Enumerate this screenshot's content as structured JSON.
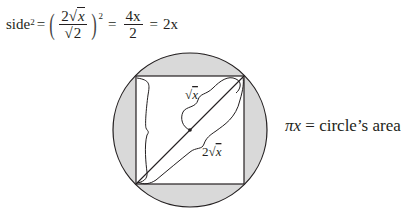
{
  "equation": {
    "lhs": "side",
    "lhs_exponent": "2",
    "equals": "=",
    "fraction1": {
      "numerator_coeff": "2",
      "numerator_radicand": "x",
      "denominator_radicand": "2"
    },
    "outer_exponent": "2",
    "fraction2": {
      "numerator": "4x",
      "denominator": "2"
    },
    "result": "2x"
  },
  "figure": {
    "circle_fill": "#d9d9d9",
    "stroke": "#231f20",
    "label_half_diagonal": "√x",
    "label_full_diagonal": "2√x"
  },
  "caption": {
    "symbol": "πx",
    "text": " = circle’s area"
  }
}
